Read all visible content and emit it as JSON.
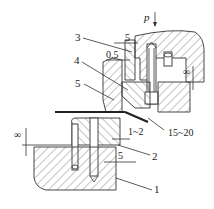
{
  "diagram": {
    "force_label": "p",
    "part_labels": [
      "1",
      "2",
      "3",
      "4",
      "5"
    ],
    "dimensions": {
      "upper_gap": "5",
      "clearance": "0.5",
      "upper_right_infinity": "∞",
      "left_infinity": "∞",
      "gap_1_2": "1~2",
      "angle_15_20": "15~20",
      "lower_gap": "5"
    }
  }
}
